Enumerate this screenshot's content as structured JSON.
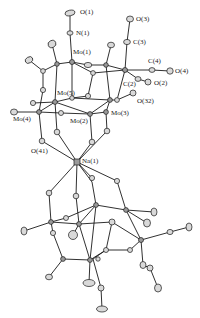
{
  "figure": {
    "type": "ORTEP molecular structure",
    "background": "#ffffff",
    "ink": "#1a1a1a",
    "labels": [
      {
        "id": "O1",
        "text": "O(1)",
        "x": 80,
        "y": 12
      },
      {
        "id": "N1",
        "text": "N(1)",
        "x": 76,
        "y": 33
      },
      {
        "id": "Mo1",
        "text": "Mo(1)",
        "x": 73,
        "y": 51
      },
      {
        "id": "O3",
        "text": "O(3)",
        "x": 139,
        "y": 18
      },
      {
        "id": "C3",
        "text": "C(3)",
        "x": 135,
        "y": 37
      },
      {
        "id": "C4",
        "text": "C(4)",
        "x": 147,
        "y": 56
      },
      {
        "id": "O4",
        "text": "O(4)",
        "x": 176,
        "y": 68
      },
      {
        "id": "C2",
        "text": "C(2)",
        "x": 124,
        "y": 79
      },
      {
        "id": "O2",
        "text": "O(2)",
        "x": 157,
        "y": 80
      },
      {
        "id": "O32",
        "text": "O(32)",
        "x": 137,
        "y": 96
      },
      {
        "id": "Mo5",
        "text": "Mo(5)",
        "x": 56,
        "y": 89
      },
      {
        "id": "Mo4",
        "text": "Mo(4)",
        "x": 13,
        "y": 112
      },
      {
        "id": "Mo2",
        "text": "Mo(2)",
        "x": 68,
        "y": 117
      },
      {
        "id": "Mo3",
        "text": "Mo(3)",
        "x": 113,
        "y": 112
      },
      {
        "id": "O41",
        "text": "O(41)",
        "x": 30,
        "y": 146
      },
      {
        "id": "Na1",
        "text": "Na(1)",
        "x": 83,
        "y": 158
      }
    ]
  }
}
